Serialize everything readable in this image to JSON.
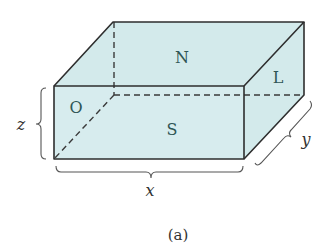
{
  "figure": {
    "caption": "(a)",
    "fill_color": "#d3eaeb",
    "edge_color": "#2e2e2e",
    "faces": {
      "top": "N",
      "front": "S",
      "left": "O",
      "right": "L"
    },
    "dimensions": {
      "width": "x",
      "depth": "y",
      "height": "z"
    }
  }
}
